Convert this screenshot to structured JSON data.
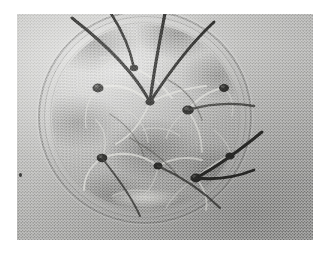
{
  "image": {
    "kind": "photograph",
    "subject": "petri-dish-with-germinating-seedlings",
    "color_mode": "grayscale",
    "caption": "",
    "border": "white print margin"
  },
  "palette": {
    "paper_white": "#ffffff",
    "background_light_gray": "#d8d8d6",
    "background_mid_gray": "#a6a6a4",
    "background_dark_gray": "#8a8a87",
    "dish_rim_gray": "#787876",
    "substrate_gray": "#949491",
    "shoot_dark": "#2a2a28",
    "root_pale": "#e2e2dd",
    "seed_black": "#2b2b29"
  },
  "photo": {
    "label": "petri-dish-photograph",
    "left": 17,
    "top": 14,
    "width": 296,
    "height": 226
  },
  "dish": {
    "label": "petri-dish",
    "shape": "circle",
    "center_x": 145,
    "center_y": 117,
    "diameter": 214,
    "rim_rings": 3,
    "contents": "moist filter paper substrate with germinated seeds"
  },
  "specimens": {
    "label": "seedlings",
    "shoot_count": 8,
    "seed_count": 9,
    "description": "dark curved hypocotyls extending beyond the dish rim with pale radicle roots spreading across the substrate"
  },
  "annotations": {
    "speck": "dust-speck-on-print"
  }
}
